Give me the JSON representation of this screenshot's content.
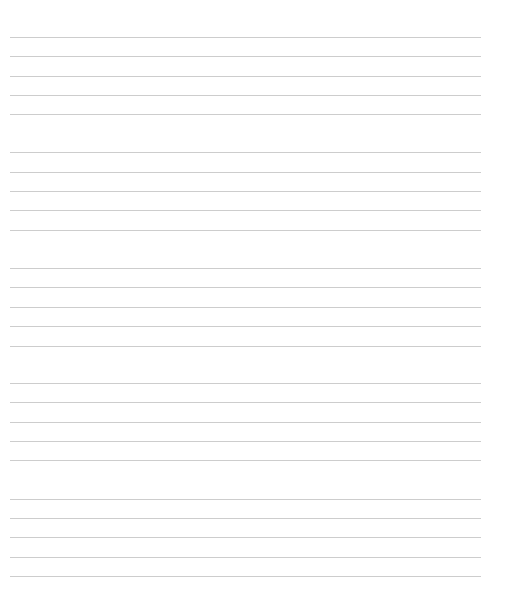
{
  "page": {
    "type": "blank-lined-paper",
    "background": "#ffffff",
    "line_color": "#cdcdcd",
    "groups": [
      {
        "lines": [
          37,
          56,
          76,
          95,
          114
        ]
      },
      {
        "lines": [
          152,
          172,
          191,
          210,
          230
        ]
      },
      {
        "lines": [
          268,
          287,
          307,
          326,
          346
        ]
      },
      {
        "lines": [
          383,
          402,
          422,
          441,
          460
        ]
      },
      {
        "lines": [
          499,
          518,
          537,
          557,
          576
        ]
      }
    ]
  }
}
